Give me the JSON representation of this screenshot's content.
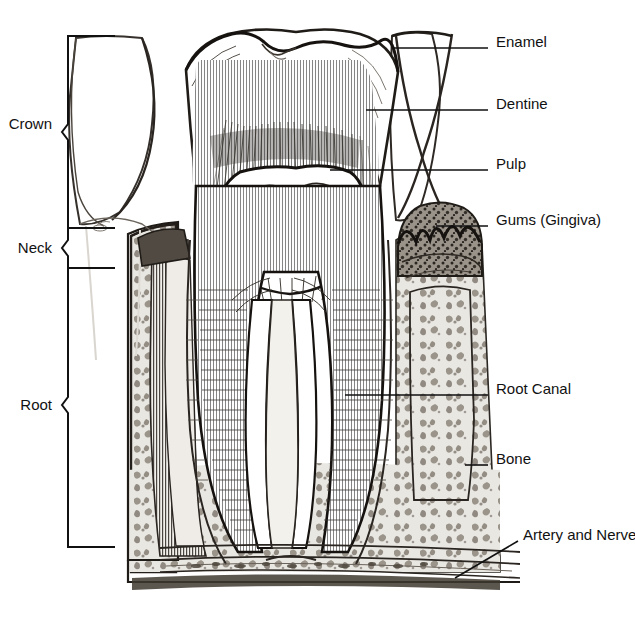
{
  "figure": {
    "kind": "anatomical-illustration",
    "style": "black and white pen-and-ink engraving",
    "background_color": "#ffffff",
    "ink_color": "#1a1a1a",
    "width": 635,
    "height": 622
  },
  "callouts": [
    {
      "id": "enamel",
      "label": "Enamel",
      "text_x": 496,
      "text_y": 41,
      "leader": {
        "x1": 392,
        "y1": 48,
        "x2": 488,
        "y2": 48
      },
      "points_to": "outer white cap layer of the crown"
    },
    {
      "id": "dentine",
      "label": "Dentine",
      "text_x": 496,
      "text_y": 103,
      "leader": {
        "x1": 366,
        "y1": 110,
        "x2": 488,
        "y2": 110
      },
      "points_to": "radially striated body beneath the enamel"
    },
    {
      "id": "pulp",
      "label": "Pulp",
      "text_x": 496,
      "text_y": 163,
      "leader": {
        "x1": 330,
        "y1": 170,
        "x2": 488,
        "y2": 170
      },
      "points_to": "soft chamber at the centre of the crown"
    },
    {
      "id": "gums",
      "label": "Gums (Gingiva)",
      "text_x": 496,
      "text_y": 219,
      "leader": {
        "x1": 436,
        "y1": 226,
        "x2": 488,
        "y2": 226
      },
      "points_to": "dark stippled gingival collar at right"
    },
    {
      "id": "root-canal",
      "label": "Root Canal",
      "text_x": 496,
      "text_y": 388,
      "leader": {
        "x1": 345,
        "y1": 395,
        "x2": 488,
        "y2": 395
      },
      "points_to": "narrow channel running down the root"
    },
    {
      "id": "bone",
      "label": "Bone",
      "text_x": 496,
      "text_y": 458,
      "leader": {
        "x1": 465,
        "y1": 465,
        "x2": 488,
        "y2": 465
      },
      "points_to": "spongy alveolar bone surrounding the root"
    },
    {
      "id": "artery-and-nerve",
      "label": "Artery and Nerve",
      "text_x": 523,
      "text_y": 534,
      "leader": {
        "x1": 455,
        "y1": 578,
        "x2": 518,
        "y2": 541
      },
      "points_to": "long vessels running along the base of the jaw"
    }
  ],
  "regions": [
    {
      "id": "crown",
      "label": "Crown",
      "text_x": 8,
      "text_y": 116,
      "bracket": {
        "x": 68,
        "top": 36,
        "bottom": 228,
        "tick_end": 115,
        "notch_y": 132
      }
    },
    {
      "id": "neck",
      "label": "Neck",
      "text_x": 17,
      "text_y": 240,
      "bracket": {
        "x": 68,
        "top": 228,
        "bottom": 268,
        "tick_end": 115,
        "notch_y": 248
      }
    },
    {
      "id": "root",
      "label": "Root",
      "text_x": 20,
      "text_y": 397,
      "bracket": {
        "x": 68,
        "top": 268,
        "bottom": 547,
        "tick_end": 115,
        "notch_y": 405
      }
    }
  ]
}
